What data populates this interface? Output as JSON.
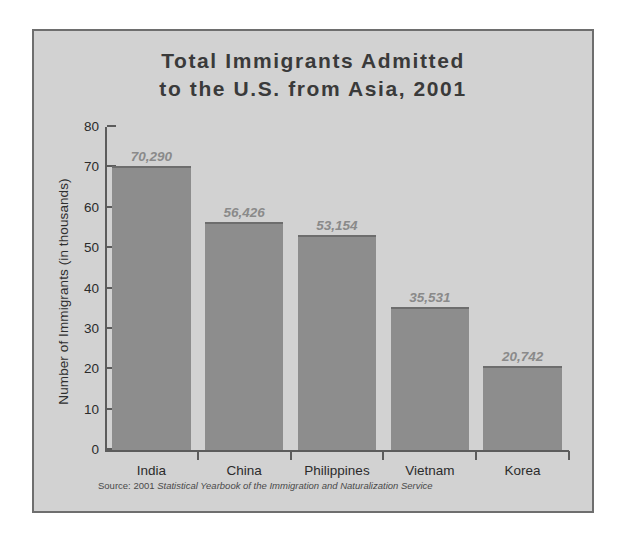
{
  "chart_data": {
    "type": "bar",
    "title": "Total Immigrants Admitted to the U.S. from Asia, 2001",
    "title_line1": "Total Immigrants Admitted",
    "title_line2": "to the U.S. from Asia, 2001",
    "xlabel": "",
    "ylabel": "Number of Immigrants (in thousands)",
    "ylim": [
      0,
      80
    ],
    "ytick_values": [
      0,
      10,
      20,
      30,
      40,
      50,
      60,
      70,
      80
    ],
    "ytick_labels": [
      "0",
      "10",
      "20",
      "30",
      "40",
      "50",
      "60",
      "70",
      "80"
    ],
    "grid": false,
    "legend": null,
    "categories": [
      "India",
      "China",
      "Philippines",
      "Vietnam",
      "Korea"
    ],
    "values": [
      70.29,
      56.426,
      53.154,
      35.531,
      20.742
    ],
    "value_labels": [
      "70,290",
      "56,426",
      "53,154",
      "35,531",
      "20,742"
    ],
    "bar_color": "#8d8d8d",
    "bar_edge_color": "#6d6d6d",
    "value_label_color": "#8a8a8a",
    "axis_color": "#5c5c5c",
    "panel_color": "#d2d2d2",
    "frame_color": "#6e6e6e",
    "title_color": "#3a3a3a",
    "tick_label_color": "#2b2b2b"
  },
  "source": {
    "prefix": "Source: 2001 ",
    "italic": "Statistical Yearbook of the Immigration and Naturalization Service"
  }
}
